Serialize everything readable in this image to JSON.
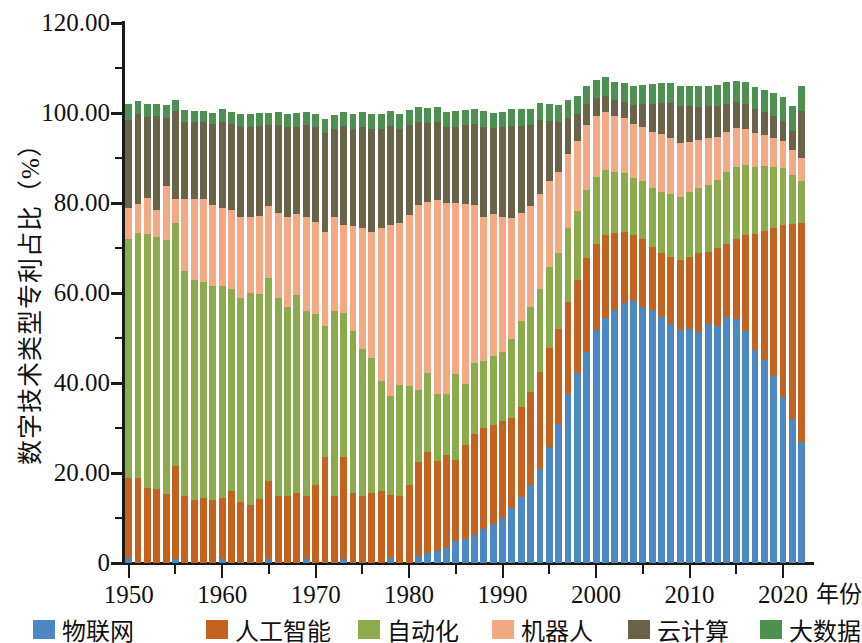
{
  "chart_data": {
    "type": "bar",
    "subtype": "stacked-bar",
    "title": "",
    "xlabel": "年份",
    "ylabel": "数字技术类型专利占比（%）",
    "ylim": [
      0,
      120
    ],
    "ytick_labels": [
      "0",
      "20.00",
      "40.00",
      "60.00",
      "80.00",
      "100.00",
      "120.00"
    ],
    "ytick_values": [
      0,
      20,
      40,
      60,
      80,
      100,
      120
    ],
    "ytick_minor_values": [
      10,
      30,
      50,
      70,
      90,
      110
    ],
    "xtick_labels": [
      "1950",
      "1960",
      "1970",
      "1980",
      "1990",
      "2000",
      "2010",
      "2020"
    ],
    "xtick_values": [
      1950,
      1960,
      1970,
      1980,
      1990,
      2000,
      2010,
      2020
    ],
    "xtick_minor_values": [
      1955,
      1965,
      1975,
      1985,
      1995,
      2005,
      2015
    ],
    "grid": false,
    "legend_position": "bottom",
    "colors": {
      "iot": "#4b88c4",
      "ai": "#c4621f",
      "automation": "#8bab4d",
      "robotics": "#f3a983",
      "cloud": "#6b6349",
      "bigdata": "#4c9150"
    },
    "series": [
      {
        "key": "iot",
        "name": "物联网",
        "color": "#4b88c4",
        "values": [
          1.2,
          0.0,
          0.0,
          0.0,
          0.0,
          1.0,
          0.0,
          0.0,
          0.0,
          0.0,
          1.0,
          0.0,
          0.0,
          0.0,
          0.0,
          0.8,
          0.0,
          0.0,
          0.0,
          0.9,
          0.0,
          0.0,
          0.0,
          1.0,
          0.0,
          0.0,
          0.0,
          0.0,
          1.2,
          0.0,
          0.0,
          1.5,
          2.2,
          2.6,
          3.4,
          5.0,
          5.3,
          6.2,
          7.5,
          8.6,
          10.0,
          12.2,
          14.7,
          17.3,
          21.0,
          25.8,
          31.0,
          37.5,
          42.3,
          47.0,
          51.8,
          54.5,
          56.3,
          57.8,
          58.2,
          57.0,
          56.3,
          54.7,
          53.1,
          51.8,
          52.0,
          51.4,
          53.2,
          52.6,
          54.6,
          54.3,
          51.5,
          47.3,
          45.2,
          41.5,
          37.0,
          32.0,
          27.0
        ]
      },
      {
        "key": "ai",
        "name": "人工智能",
        "color": "#c4621f",
        "values": [
          17.8,
          18.8,
          16.6,
          16.4,
          15.3,
          20.5,
          15.0,
          14.0,
          14.5,
          14.0,
          13.5,
          16.0,
          13.5,
          13.0,
          14.2,
          17.5,
          14.8,
          15.0,
          15.5,
          14.0,
          17.3,
          23.6,
          15.0,
          22.6,
          15.5,
          15.0,
          15.5,
          16.0,
          14.0,
          15.0,
          17.4,
          21.0,
          22.5,
          20.0,
          20.5,
          18.0,
          21.0,
          22.5,
          22.5,
          22.0,
          21.5,
          20.0,
          20.0,
          20.8,
          21.5,
          22.0,
          21.0,
          20.5,
          20.5,
          20.8,
          19.0,
          18.3,
          17.0,
          15.8,
          14.8,
          15.0,
          14.0,
          14.3,
          15.0,
          15.6,
          16.0,
          17.5,
          16.0,
          17.3,
          16.4,
          17.8,
          21.5,
          25.8,
          28.5,
          33.0,
          38.2,
          43.3,
          48.5
        ]
      },
      {
        "key": "automation",
        "name": "自动化",
        "color": "#8bab4d",
        "values": [
          53.0,
          54.5,
          56.5,
          56.0,
          56.5,
          54.0,
          50.0,
          49.0,
          48.0,
          47.5,
          47.0,
          45.0,
          45.5,
          47.0,
          45.5,
          45.0,
          44.0,
          42.0,
          44.0,
          41.0,
          38.0,
          29.0,
          41.0,
          32.0,
          36.0,
          32.5,
          30.0,
          24.5,
          22.0,
          24.5,
          22.0,
          16.0,
          17.6,
          15.0,
          13.6,
          19.0,
          13.5,
          15.8,
          15.0,
          15.5,
          15.3,
          17.5,
          19.0,
          18.7,
          18.5,
          18.0,
          17.0,
          16.5,
          15.5,
          15.0,
          15.0,
          14.5,
          13.5,
          13.0,
          12.5,
          13.0,
          13.0,
          13.5,
          13.8,
          14.0,
          14.5,
          14.5,
          14.8,
          15.3,
          15.8,
          16.0,
          15.5,
          15.0,
          14.5,
          13.5,
          12.5,
          11.0,
          9.5
        ]
      },
      {
        "key": "robotics",
        "name": "机器人",
        "color": "#f3a983",
        "values": [
          7.0,
          6.5,
          8.0,
          6.0,
          12.0,
          5.5,
          16.0,
          18.0,
          18.5,
          18.0,
          17.5,
          17.5,
          18.0,
          17.0,
          17.5,
          16.0,
          19.0,
          20.0,
          18.0,
          21.0,
          20.5,
          21.0,
          21.0,
          19.5,
          23.5,
          27.0,
          28.0,
          34.0,
          38.0,
          36.0,
          38.0,
          41.0,
          38.0,
          43.0,
          42.5,
          38.0,
          40.0,
          35.0,
          32.0,
          31.5,
          30.0,
          27.0,
          24.0,
          22.5,
          21.0,
          19.0,
          18.0,
          16.5,
          15.5,
          14.5,
          13.5,
          13.0,
          12.5,
          12.3,
          12.0,
          11.8,
          12.5,
          12.8,
          12.5,
          12.0,
          11.0,
          10.5,
          10.5,
          9.5,
          9.0,
          8.5,
          8.0,
          7.5,
          7.0,
          6.5,
          6.0,
          5.5,
          5.0
        ]
      },
      {
        "key": "cloud",
        "name": "云计算",
        "color": "#6b6349",
        "values": [
          19.5,
          20.0,
          18.0,
          21.0,
          15.0,
          19.5,
          17.0,
          17.0,
          17.0,
          18.0,
          19.0,
          19.0,
          20.0,
          20.0,
          20.0,
          18.0,
          19.5,
          20.0,
          19.5,
          20.5,
          21.0,
          22.0,
          19.5,
          22.0,
          21.5,
          22.5,
          23.0,
          22.0,
          22.0,
          21.0,
          20.0,
          18.5,
          17.5,
          17.5,
          17.0,
          17.0,
          17.5,
          18.0,
          20.0,
          19.0,
          20.0,
          20.5,
          19.5,
          18.0,
          16.5,
          13.5,
          11.0,
          8.0,
          6.0,
          4.8,
          4.0,
          3.5,
          3.5,
          3.6,
          4.2,
          5.3,
          6.3,
          7.0,
          7.8,
          8.2,
          8.0,
          7.5,
          7.0,
          6.8,
          6.2,
          5.8,
          5.5,
          5.2,
          5.0,
          4.8,
          4.5,
          4.3,
          10.5
        ]
      },
      {
        "key": "bigdata",
        "name": "大数据",
        "color": "#4c9150",
        "values": [
          3.5,
          2.8,
          3.0,
          2.7,
          3.0,
          2.5,
          2.7,
          2.5,
          2.5,
          2.6,
          2.8,
          2.7,
          2.8,
          2.8,
          2.8,
          2.7,
          2.9,
          2.8,
          3.0,
          2.8,
          3.0,
          3.1,
          3.0,
          3.2,
          3.2,
          3.2,
          3.3,
          3.3,
          3.2,
          3.3,
          3.3,
          3.3,
          3.3,
          3.3,
          3.3,
          3.4,
          3.4,
          3.5,
          3.5,
          3.5,
          3.5,
          3.6,
          3.6,
          3.6,
          3.7,
          3.7,
          3.8,
          3.8,
          3.9,
          4.0,
          4.0,
          4.1,
          4.1,
          4.2,
          4.2,
          4.2,
          4.3,
          4.3,
          4.4,
          4.5,
          4.5,
          4.6,
          4.6,
          4.7,
          4.8,
          4.8,
          4.9,
          5.0,
          5.0,
          5.2,
          5.3,
          5.4,
          5.5
        ]
      },
      {
        "key": "years",
        "name": "years",
        "values": [
          1950,
          1951,
          1952,
          1953,
          1954,
          1955,
          1956,
          1957,
          1958,
          1959,
          1960,
          1961,
          1962,
          1963,
          1964,
          1965,
          1966,
          1967,
          1968,
          1969,
          1970,
          1971,
          1972,
          1973,
          1974,
          1975,
          1976,
          1977,
          1978,
          1979,
          1980,
          1981,
          1982,
          1983,
          1984,
          1985,
          1986,
          1987,
          1988,
          1989,
          1990,
          1991,
          1992,
          1993,
          1994,
          1995,
          1996,
          1997,
          1998,
          1999,
          2000,
          2001,
          2002,
          2003,
          2004,
          2005,
          2006,
          2007,
          2008,
          2009,
          2010,
          2011,
          2012,
          2013,
          2014,
          2015,
          2016,
          2017,
          2018,
          2019,
          2020,
          2021,
          2022
        ]
      }
    ]
  },
  "legend": {
    "items": [
      {
        "label": "物联网",
        "color": "#4b88c4"
      },
      {
        "label": "人工智能",
        "color": "#c4621f"
      },
      {
        "label": "自动化",
        "color": "#8bab4d"
      },
      {
        "label": "机器人",
        "color": "#f3a983"
      },
      {
        "label": "云计算",
        "color": "#6b6349"
      },
      {
        "label": "大数据",
        "color": "#4c9150"
      }
    ]
  }
}
